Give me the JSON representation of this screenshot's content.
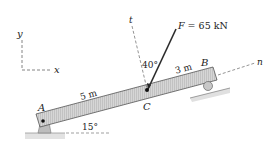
{
  "diagram": {
    "type": "statics-beam",
    "axes": {
      "y_label": "y",
      "x_label": "x"
    },
    "points": {
      "A": "A",
      "B": "B",
      "C": "C"
    },
    "force": {
      "label": "F = 65 kN",
      "symbol": "F",
      "value": "65 kN"
    },
    "dimensions": {
      "AC": "5 m",
      "CB": "3 m"
    },
    "angles": {
      "incline": "15°",
      "force_from_t": "40°"
    },
    "rotated_axes": {
      "t": "t",
      "n": "n"
    },
    "colors": {
      "beam_fill": "#d4d4d4",
      "beam_stroke": "#555555",
      "force": "#2a2a2a",
      "ground": "#bdbdbd"
    }
  }
}
